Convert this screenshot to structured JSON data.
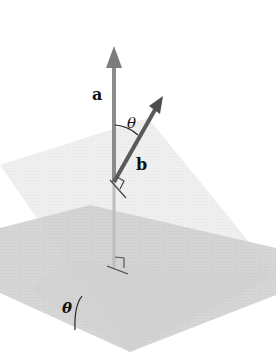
{
  "diagram": {
    "labels": {
      "normal_a": "a",
      "normal_b": "b",
      "angle_between_normals": "θ",
      "angle_between_planes": "θ"
    },
    "colors": {
      "background": "#ffffff",
      "horizontal_plane": "#d4d4d4",
      "tilted_plane": "#ececec",
      "vector_a": "#8a8a8a",
      "vector_b": "#5a5a5a",
      "text": "#111111"
    },
    "elements": [
      {
        "type": "plane",
        "name": "horizontal-plane"
      },
      {
        "type": "plane",
        "name": "tilted-plane"
      },
      {
        "type": "vector",
        "name": "a",
        "direction": "vertical (normal to horizontal plane)"
      },
      {
        "type": "vector",
        "name": "b",
        "direction": "normal to tilted plane"
      },
      {
        "type": "right-angle-marker",
        "count": 2
      },
      {
        "type": "angle-arc",
        "between": [
          "a",
          "b"
        ],
        "label": "θ"
      },
      {
        "type": "angle-arc",
        "between": [
          "horizontal-plane",
          "tilted-plane"
        ],
        "label": "θ"
      }
    ]
  }
}
